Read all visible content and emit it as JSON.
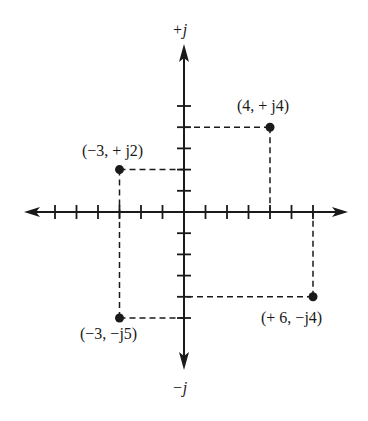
{
  "figure": {
    "axis_labels": {
      "imag_positive": "+j",
      "imag_negative": "−j"
    },
    "points": [
      {
        "label": "(−3, + j2)",
        "re": -3,
        "im": 2
      },
      {
        "label": "(4, + j4)",
        "re": 4,
        "im": 4
      },
      {
        "label": "(−3, −j5)",
        "re": -3,
        "im": -5
      },
      {
        "label": "(+ 6, −j4)",
        "re": 6,
        "im": -4
      }
    ]
  },
  "chart_data": {
    "type": "scatter",
    "title": "",
    "xlabel": "",
    "ylabel": "",
    "axis_annotations": {
      "top": "+j",
      "bottom": "−j"
    },
    "xlim": [
      -7,
      7
    ],
    "ylim": [
      -6,
      6
    ],
    "x_ticks": [
      -6,
      -5,
      -4,
      -3,
      -2,
      -1,
      1,
      2,
      3,
      4,
      5,
      6
    ],
    "y_ticks": [
      -5,
      -4,
      -3,
      -2,
      -1,
      1,
      2,
      3,
      4,
      5
    ],
    "grid": false,
    "series": [
      {
        "name": "complex points",
        "x": [
          -3,
          4,
          -3,
          6
        ],
        "y": [
          2,
          4,
          -5,
          -4
        ],
        "labels": [
          "(−3, + j2)",
          "(4, + j4)",
          "(−3, −j5)",
          "(+ 6, −j4)"
        ]
      }
    ],
    "projection_lines": "dashed lines from each point to both axes"
  },
  "colors": {
    "ink": "#1a1a1a",
    "background": "#ffffff"
  }
}
